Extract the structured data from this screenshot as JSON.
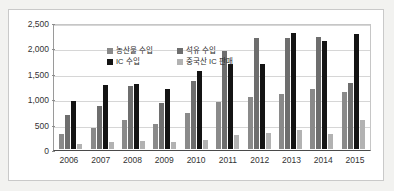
{
  "chart_data": {
    "type": "bar",
    "title": "",
    "xlabel": "",
    "ylabel": "",
    "ylim": [
      0,
      2500
    ],
    "ytick_labels": [
      "2,500",
      "2,000",
      "1,500",
      "1,000",
      "500",
      "0"
    ],
    "ytick_values": [
      2500,
      2000,
      1500,
      1000,
      500,
      0
    ],
    "grid": true,
    "legend_position": "top-left-inside",
    "categories": [
      "2006",
      "2007",
      "2008",
      "2009",
      "2010",
      "2011",
      "2012",
      "2013",
      "2014",
      "2015"
    ],
    "series": [
      {
        "name": "농산물 수입",
        "color": "#8a8a8a",
        "values": [
          310,
          415,
          575,
          510,
          715,
          935,
          1040,
          1095,
          1205,
          1135
        ]
      },
      {
        "name": "석유 수입",
        "color": "#6e6e6e",
        "values": [
          685,
          865,
          1270,
          915,
          1365,
          1960,
          2230,
          2230,
          2250,
          1330
        ]
      },
      {
        "name": "IC 수입",
        "color": "#141414",
        "values": [
          960,
          1290,
          1300,
          1195,
          1560,
          1700,
          1710,
          2325,
          2170,
          2310
        ]
      },
      {
        "name": "중국산 IC 판매",
        "color": "#b2b2b2",
        "values": [
          110,
          140,
          160,
          135,
          180,
          280,
          320,
          390,
          295,
          580
        ]
      }
    ]
  },
  "legend": {
    "items": [
      {
        "label": "농산물 수입"
      },
      {
        "label": "석유 수입"
      },
      {
        "label": "IC 수입"
      },
      {
        "label": "중국산 IC 판매"
      }
    ]
  }
}
